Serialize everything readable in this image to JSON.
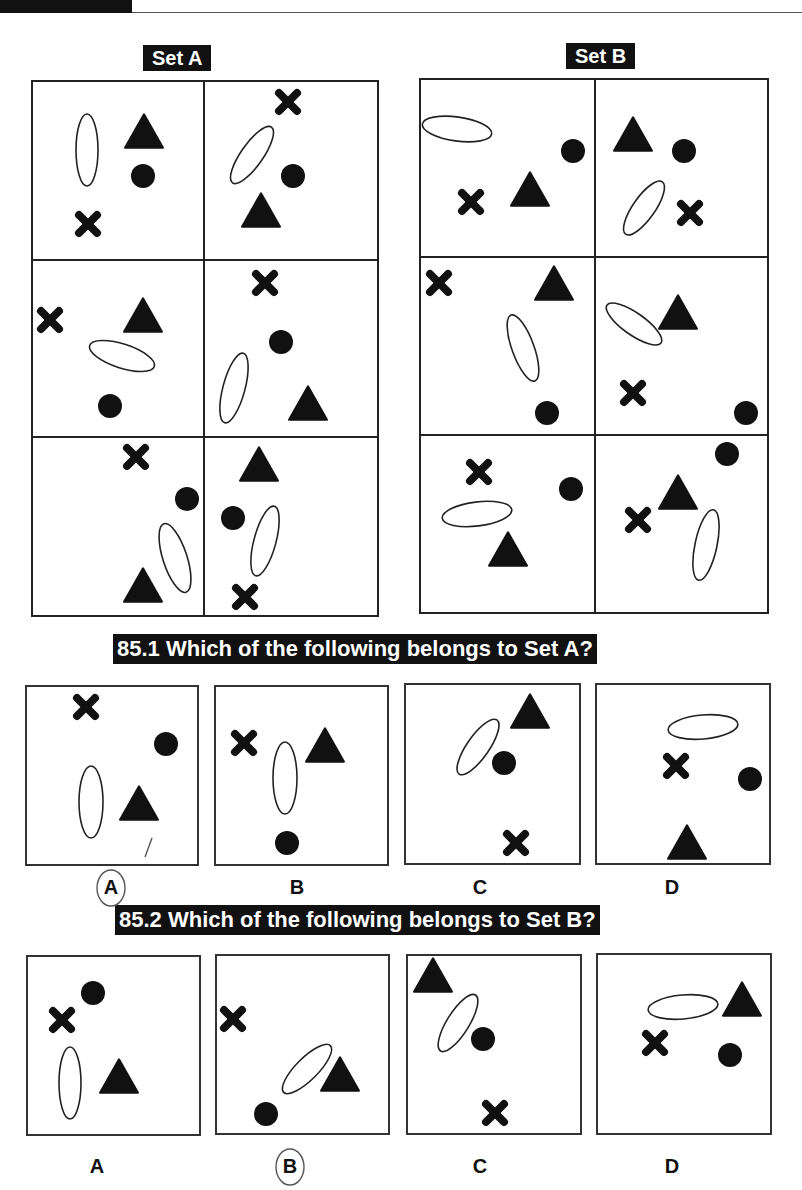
{
  "header": {
    "tab_color": "#111111"
  },
  "set_a": {
    "label": "Set A",
    "frame": {
      "x": 32,
      "y": 81,
      "w": 346,
      "h": 535,
      "col_div": 204,
      "row_divs": [
        260,
        437
      ]
    },
    "cells": [
      {
        "shapes": [
          {
            "type": "ellipse",
            "x": 87,
            "y": 150,
            "rx": 11,
            "ry": 36,
            "rot": 0
          },
          {
            "type": "triangle",
            "x": 144,
            "y": 131,
            "size": 38
          },
          {
            "type": "circle",
            "x": 143,
            "y": 176,
            "r": 12
          },
          {
            "type": "cross",
            "x": 88,
            "y": 224,
            "size": 24
          }
        ]
      },
      {
        "shapes": [
          {
            "type": "cross",
            "x": 288,
            "y": 102,
            "size": 24
          },
          {
            "type": "ellipse",
            "x": 252,
            "y": 155,
            "rx": 11,
            "ry": 34,
            "rot": 35
          },
          {
            "type": "circle",
            "x": 293,
            "y": 176,
            "r": 12
          },
          {
            "type": "triangle",
            "x": 261,
            "y": 210,
            "size": 38
          }
        ]
      },
      {
        "shapes": [
          {
            "type": "cross",
            "x": 50,
            "y": 320,
            "size": 24
          },
          {
            "type": "triangle",
            "x": 143,
            "y": 315,
            "size": 38
          },
          {
            "type": "ellipse",
            "x": 122,
            "y": 356,
            "rx": 34,
            "ry": 12,
            "rot": 18
          },
          {
            "type": "circle",
            "x": 110,
            "y": 406,
            "r": 12
          }
        ]
      },
      {
        "shapes": [
          {
            "type": "cross",
            "x": 265,
            "y": 283,
            "size": 24
          },
          {
            "type": "circle",
            "x": 281,
            "y": 342,
            "r": 12
          },
          {
            "type": "ellipse",
            "x": 234,
            "y": 388,
            "rx": 11,
            "ry": 36,
            "rot": 15
          },
          {
            "type": "triangle",
            "x": 308,
            "y": 403,
            "size": 38
          }
        ]
      },
      {
        "shapes": [
          {
            "type": "cross",
            "x": 136,
            "y": 457,
            "size": 24
          },
          {
            "type": "circle",
            "x": 187,
            "y": 499,
            "r": 12
          },
          {
            "type": "ellipse",
            "x": 175,
            "y": 558,
            "rx": 12,
            "ry": 36,
            "rot": -18
          },
          {
            "type": "triangle",
            "x": 143,
            "y": 585,
            "size": 38
          }
        ]
      },
      {
        "shapes": [
          {
            "type": "triangle",
            "x": 259,
            "y": 464,
            "size": 38
          },
          {
            "type": "circle",
            "x": 233,
            "y": 518,
            "r": 12
          },
          {
            "type": "ellipse",
            "x": 265,
            "y": 541,
            "rx": 11,
            "ry": 36,
            "rot": 15
          },
          {
            "type": "cross",
            "x": 245,
            "y": 597,
            "size": 24
          }
        ]
      }
    ]
  },
  "set_b": {
    "label": "Set B",
    "frame": {
      "x": 420,
      "y": 79,
      "w": 348,
      "h": 534,
      "col_div": 595,
      "row_divs": [
        257,
        435
      ]
    },
    "cells": [
      {
        "shapes": [
          {
            "type": "ellipse",
            "x": 457,
            "y": 129,
            "rx": 35,
            "ry": 12,
            "rot": 8
          },
          {
            "type": "circle",
            "x": 573,
            "y": 151,
            "r": 12
          },
          {
            "type": "triangle",
            "x": 530,
            "y": 189,
            "size": 38
          },
          {
            "type": "cross",
            "x": 471,
            "y": 202,
            "size": 24
          }
        ]
      },
      {
        "shapes": [
          {
            "type": "triangle",
            "x": 633,
            "y": 134,
            "size": 38
          },
          {
            "type": "circle",
            "x": 684,
            "y": 151,
            "r": 12
          },
          {
            "type": "ellipse",
            "x": 644,
            "y": 208,
            "rx": 11,
            "ry": 32,
            "rot": 35
          },
          {
            "type": "cross",
            "x": 690,
            "y": 213,
            "size": 24
          }
        ]
      },
      {
        "shapes": [
          {
            "type": "cross",
            "x": 439,
            "y": 283,
            "size": 24
          },
          {
            "type": "triangle",
            "x": 554,
            "y": 283,
            "size": 38
          },
          {
            "type": "ellipse",
            "x": 523,
            "y": 348,
            "rx": 11,
            "ry": 35,
            "rot": -20
          },
          {
            "type": "circle",
            "x": 547,
            "y": 413,
            "r": 12
          }
        ]
      },
      {
        "shapes": [
          {
            "type": "ellipse",
            "x": 634,
            "y": 324,
            "rx": 33,
            "ry": 11,
            "rot": 35
          },
          {
            "type": "triangle",
            "x": 678,
            "y": 312,
            "size": 38
          },
          {
            "type": "cross",
            "x": 633,
            "y": 393,
            "size": 24
          },
          {
            "type": "circle",
            "x": 746,
            "y": 413,
            "r": 12
          }
        ]
      },
      {
        "shapes": [
          {
            "type": "cross",
            "x": 479,
            "y": 472,
            "size": 24
          },
          {
            "type": "circle",
            "x": 571,
            "y": 489,
            "r": 12
          },
          {
            "type": "ellipse",
            "x": 477,
            "y": 514,
            "rx": 35,
            "ry": 12,
            "rot": -7
          },
          {
            "type": "triangle",
            "x": 508,
            "y": 549,
            "size": 38
          }
        ]
      },
      {
        "shapes": [
          {
            "type": "circle",
            "x": 727,
            "y": 454,
            "r": 12
          },
          {
            "type": "triangle",
            "x": 678,
            "y": 492,
            "size": 38
          },
          {
            "type": "cross",
            "x": 638,
            "y": 520,
            "size": 24
          },
          {
            "type": "ellipse",
            "x": 706,
            "y": 545,
            "rx": 11,
            "ry": 36,
            "rot": 12
          }
        ]
      }
    ]
  },
  "questions": [
    {
      "title": "85.1 Which of the following belongs to Set A?",
      "title_pos": {
        "x": 113,
        "y": 634
      },
      "options": [
        {
          "label": "A",
          "box": {
            "x": 26,
            "y": 686,
            "w": 172,
            "h": 179
          },
          "label_x": 111,
          "label_y": 876,
          "marked": true,
          "shapes": [
            {
              "type": "cross",
              "x": 86,
              "y": 707,
              "size": 24
            },
            {
              "type": "circle",
              "x": 166,
              "y": 744,
              "r": 12
            },
            {
              "type": "ellipse",
              "x": 91,
              "y": 802,
              "rx": 12,
              "ry": 36,
              "rot": 0
            },
            {
              "type": "triangle",
              "x": 139,
              "y": 803,
              "size": 38
            }
          ]
        },
        {
          "label": "B",
          "box": {
            "x": 215,
            "y": 686,
            "w": 173,
            "h": 179
          },
          "label_x": 297,
          "label_y": 876,
          "marked": false,
          "shapes": [
            {
              "type": "cross",
              "x": 244,
              "y": 743,
              "size": 24
            },
            {
              "type": "triangle",
              "x": 325,
              "y": 745,
              "size": 38
            },
            {
              "type": "ellipse",
              "x": 285,
              "y": 778,
              "rx": 12,
              "ry": 36,
              "rot": 0
            },
            {
              "type": "circle",
              "x": 287,
              "y": 843,
              "r": 12
            }
          ]
        },
        {
          "label": "C",
          "box": {
            "x": 405,
            "y": 684,
            "w": 175,
            "h": 180
          },
          "label_x": 480,
          "label_y": 876,
          "marked": false,
          "shapes": [
            {
              "type": "triangle",
              "x": 530,
              "y": 711,
              "size": 38
            },
            {
              "type": "ellipse",
              "x": 478,
              "y": 747,
              "rx": 11,
              "ry": 33,
              "rot": 35
            },
            {
              "type": "circle",
              "x": 504,
              "y": 763,
              "r": 12
            },
            {
              "type": "cross",
              "x": 516,
              "y": 843,
              "size": 24
            }
          ]
        },
        {
          "label": "D",
          "box": {
            "x": 596,
            "y": 684,
            "w": 174,
            "h": 180
          },
          "label_x": 672,
          "label_y": 876,
          "marked": false,
          "shapes": [
            {
              "type": "ellipse",
              "x": 703,
              "y": 727,
              "rx": 35,
              "ry": 12,
              "rot": -5
            },
            {
              "type": "cross",
              "x": 676,
              "y": 766,
              "size": 24
            },
            {
              "type": "circle",
              "x": 750,
              "y": 779,
              "r": 12
            },
            {
              "type": "triangle",
              "x": 687,
              "y": 842,
              "size": 38
            }
          ]
        }
      ]
    },
    {
      "title": "85.2 Which of the following belongs to Set B?",
      "title_pos": {
        "x": 115,
        "y": 905
      },
      "options": [
        {
          "label": "A",
          "box": {
            "x": 27,
            "y": 956,
            "w": 173,
            "h": 179
          },
          "label_x": 97,
          "label_y": 1155,
          "marked": false,
          "shapes": [
            {
              "type": "circle",
              "x": 93,
              "y": 993,
              "r": 12
            },
            {
              "type": "cross",
              "x": 62,
              "y": 1020,
              "size": 24
            },
            {
              "type": "ellipse",
              "x": 70,
              "y": 1083,
              "rx": 11,
              "ry": 36,
              "rot": 0
            },
            {
              "type": "triangle",
              "x": 119,
              "y": 1076,
              "size": 38
            }
          ]
        },
        {
          "label": "B",
          "box": {
            "x": 216,
            "y": 955,
            "w": 173,
            "h": 179
          },
          "label_x": 290,
          "label_y": 1155,
          "marked": true,
          "shapes": [
            {
              "type": "cross",
              "x": 233,
              "y": 1019,
              "size": 24
            },
            {
              "type": "ellipse",
              "x": 307,
              "y": 1069,
              "rx": 11,
              "ry": 33,
              "rot": 45
            },
            {
              "type": "triangle",
              "x": 340,
              "y": 1074,
              "size": 38
            },
            {
              "type": "circle",
              "x": 266,
              "y": 1114,
              "r": 12
            }
          ]
        },
        {
          "label": "C",
          "box": {
            "x": 407,
            "y": 955,
            "w": 174,
            "h": 179
          },
          "label_x": 480,
          "label_y": 1155,
          "marked": false,
          "shapes": [
            {
              "type": "triangle",
              "x": 433,
              "y": 975,
              "size": 38
            },
            {
              "type": "ellipse",
              "x": 458,
              "y": 1023,
              "rx": 11,
              "ry": 33,
              "rot": 32
            },
            {
              "type": "circle",
              "x": 483,
              "y": 1039,
              "r": 12
            },
            {
              "type": "cross",
              "x": 495,
              "y": 1113,
              "size": 24
            }
          ]
        },
        {
          "label": "D",
          "box": {
            "x": 597,
            "y": 954,
            "w": 174,
            "h": 180
          },
          "label_x": 672,
          "label_y": 1155,
          "marked": false,
          "shapes": [
            {
              "type": "ellipse",
              "x": 683,
              "y": 1007,
              "rx": 35,
              "ry": 12,
              "rot": -5
            },
            {
              "type": "triangle",
              "x": 742,
              "y": 999,
              "size": 38
            },
            {
              "type": "cross",
              "x": 655,
              "y": 1043,
              "size": 24
            },
            {
              "type": "circle",
              "x": 730,
              "y": 1055,
              "r": 12
            }
          ]
        }
      ]
    }
  ]
}
